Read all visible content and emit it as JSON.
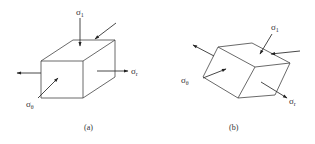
{
  "figure": {
    "panels": [
      {
        "id": "a",
        "caption": "(a)",
        "labels": {
          "sigma_1": {
            "symbol": "σ",
            "subscript": "1"
          },
          "sigma_r": {
            "symbol": "σ",
            "subscript": "r"
          },
          "sigma_theta": {
            "symbol": "σ",
            "subscript": "θ"
          }
        }
      },
      {
        "id": "b",
        "caption": "(b)",
        "labels": {
          "sigma_1": {
            "symbol": "σ",
            "subscript": "1"
          },
          "sigma_r": {
            "symbol": "σ",
            "subscript": "r"
          },
          "sigma_theta": {
            "symbol": "σ",
            "subscript": "θ"
          }
        }
      }
    ],
    "colors": {
      "line": "#444444",
      "text": "#333333",
      "background": "#ffffff"
    }
  }
}
